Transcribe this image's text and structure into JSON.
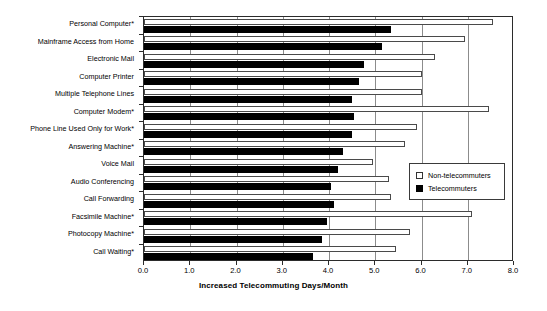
{
  "chart_data": {
    "type": "bar",
    "orientation": "horizontal",
    "title": "",
    "xlabel": "Increased Telecommuting Days/Month",
    "ylabel": "",
    "xlim": [
      0.0,
      8.0
    ],
    "xticks": [
      "0.0",
      "1.0",
      "2.0",
      "3.0",
      "4.0",
      "5.0",
      "6.0",
      "7.0",
      "8.0"
    ],
    "xtick_values": [
      0.0,
      1.0,
      2.0,
      3.0,
      4.0,
      5.0,
      6.0,
      7.0,
      8.0
    ],
    "grid": true,
    "legend_position": "center-right",
    "categories": [
      "Personal Computer*",
      "Mainframe Access from Home",
      "Electronic Mail",
      "Computer Printer",
      "Multiple Telephone Lines",
      "Computer Modem*",
      "Phone Line Used Only for Work*",
      "Answering Machine*",
      "Voice Mail",
      "Audio Conferencing",
      "Call Forwarding",
      "Facsimile Machine*",
      "Photocopy Machine*",
      "Call Waiting*"
    ],
    "series": [
      {
        "name": "Non-telecommuters",
        "color": "#ffffff",
        "values": [
          7.55,
          6.95,
          6.3,
          6.0,
          6.0,
          7.45,
          5.9,
          5.65,
          4.95,
          5.3,
          5.35,
          7.1,
          5.75,
          5.45
        ]
      },
      {
        "name": "Telecommuters",
        "color": "#000000",
        "values": [
          5.35,
          5.15,
          4.75,
          4.65,
          4.5,
          4.55,
          4.5,
          4.3,
          4.2,
          4.05,
          4.1,
          3.95,
          3.85,
          3.65
        ]
      }
    ]
  },
  "legend": {
    "items": [
      {
        "label": "Non-telecommuters",
        "swatch": "hollow-square-swatch"
      },
      {
        "label": "Telecommuters",
        "swatch": "filled-square-swatch"
      }
    ]
  }
}
